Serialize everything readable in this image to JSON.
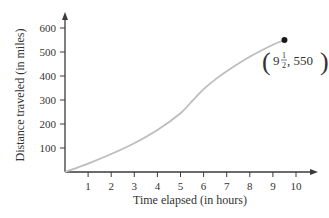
{
  "chart_data": {
    "type": "line",
    "title": "",
    "xlabel": "Time elapsed (in hours)",
    "ylabel": "Distance traveled (in miles)",
    "xlim": [
      0,
      10
    ],
    "ylim": [
      0,
      600
    ],
    "x_ticks": [
      1,
      2,
      3,
      4,
      5,
      6,
      7,
      8,
      9,
      10
    ],
    "y_ticks": [
      100,
      200,
      300,
      400,
      500,
      600
    ],
    "grid": false,
    "legend": null,
    "series": [
      {
        "name": "Distance",
        "x": [
          0,
          1,
          2,
          3,
          4,
          5,
          5.5,
          6,
          6.5,
          7,
          8,
          9,
          9.5
        ],
        "values": [
          0,
          35,
          75,
          120,
          175,
          245,
          295,
          345,
          385,
          420,
          480,
          530,
          550
        ]
      }
    ],
    "highlight_point": {
      "x": 9.5,
      "y": 550
    },
    "annotations": [
      {
        "text_whole": "9",
        "text_num": "1",
        "text_den": "2",
        "text_rest": ", 550",
        "x": 9.5,
        "y": 550
      }
    ]
  },
  "labels": {
    "xlabel": "Time elapsed (in hours)",
    "ylabel": "Distance traveled (in miles)",
    "annotation_whole": "9",
    "annotation_num": "1",
    "annotation_den": "2",
    "annotation_rest": ", 550"
  },
  "colors": {
    "axis": "#3a3a3a",
    "curve": "#bdbdbd",
    "point": "#1a1a1a"
  }
}
